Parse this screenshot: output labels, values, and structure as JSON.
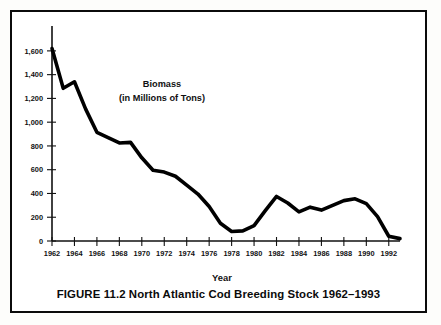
{
  "figure": {
    "caption": "FIGURE 11.2 North Atlantic Cod Breeding Stock 1962–1993",
    "annotation_line1": "Biomass",
    "annotation_line2": "(in Millions of Tons)",
    "xaxis_title": "Year",
    "border_color": "#0b0b0b",
    "line_color": "#000000",
    "background_color": "#ffffff"
  },
  "chart_data": {
    "type": "line",
    "title": "FIGURE 11.2 North Atlantic Cod Breeding Stock 1962–1993",
    "xlabel": "Year",
    "ylabel": "Biomass (in Millions of Tons)",
    "annotation": "Biomass (in Millions of Tons)",
    "grid": false,
    "legend": false,
    "xlim": [
      1962,
      1993
    ],
    "ylim": [
      0,
      1700
    ],
    "ytick_labels": [
      "0",
      "200",
      "400",
      "600",
      "800",
      "1,000",
      "1,200",
      "1,400",
      "1,600"
    ],
    "ytick_values": [
      0,
      200,
      400,
      600,
      800,
      1000,
      1200,
      1400,
      1600
    ],
    "xtick_labels": [
      "1962",
      "1964",
      "1966",
      "1968",
      "1970",
      "1972",
      "1974",
      "1976",
      "1978",
      "1980",
      "1982",
      "1984",
      "1986",
      "1988",
      "1990",
      "1992"
    ],
    "xtick_values": [
      1962,
      1964,
      1966,
      1968,
      1970,
      1972,
      1974,
      1976,
      1978,
      1980,
      1982,
      1984,
      1986,
      1988,
      1990,
      1992
    ],
    "x": [
      1962,
      1963,
      1964,
      1965,
      1966,
      1967,
      1968,
      1969,
      1970,
      1971,
      1972,
      1973,
      1974,
      1975,
      1976,
      1977,
      1978,
      1979,
      1980,
      1981,
      1982,
      1983,
      1984,
      1985,
      1986,
      1987,
      1988,
      1989,
      1990,
      1991,
      1992,
      1993
    ],
    "series": [
      {
        "name": "Biomass",
        "values": [
          1620,
          1285,
          1340,
          1110,
          915,
          870,
          825,
          830,
          700,
          595,
          580,
          545,
          470,
          395,
          290,
          150,
          80,
          85,
          130,
          255,
          375,
          320,
          245,
          285,
          260,
          300,
          340,
          355,
          315,
          205,
          40,
          20
        ]
      }
    ]
  }
}
